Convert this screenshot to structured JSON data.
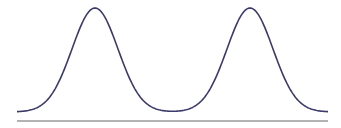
{
  "chart_data": {
    "type": "line",
    "title": "",
    "xlabel": "",
    "ylabel": "",
    "grid": false,
    "legend": null,
    "series": [
      {
        "name": "density",
        "components": [
          {
            "mean_px": 95,
            "peak_px": 8,
            "sigma_px": 23
          },
          {
            "mean_px": 250,
            "peak_px": 8,
            "sigma_px": 23
          }
        ]
      }
    ],
    "x_range_px": [
      17,
      328
    ],
    "baseline_y_px": 121,
    "floor_y_px": 112
  },
  "colors": {
    "curve": "#3b3a6b",
    "baseline": "#9a9a9a",
    "background": "#ffffff"
  }
}
